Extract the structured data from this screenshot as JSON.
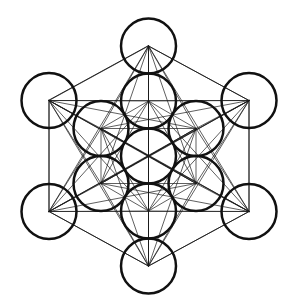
{
  "figure": {
    "subtitle": "Fruit of Life with 78 connecting lines",
    "background_color": "#ffffff",
    "stroke_color": "#111111",
    "line_color": "#1a1a1a",
    "circle_stroke_width": 2.5,
    "line_stroke_width": 0.7,
    "canvas": {
      "width": 292,
      "height": 308
    },
    "circle_radius": 27.5,
    "center": {
      "x": 148.5,
      "y": 156
    },
    "ring_spacing": 55,
    "circle_count": 13,
    "line_count": 78,
    "nodes": [
      {
        "name": "center",
        "ring": 0,
        "x": 148.5,
        "y": 156
      },
      {
        "name": "inner-n",
        "ring": 1,
        "x": 148.5,
        "y": 101
      },
      {
        "name": "inner-ne",
        "ring": 1,
        "x": 196.0,
        "y": 128.5
      },
      {
        "name": "inner-se",
        "ring": 1,
        "x": 196.0,
        "y": 183.5
      },
      {
        "name": "inner-s",
        "ring": 1,
        "x": 148.5,
        "y": 211
      },
      {
        "name": "inner-sw",
        "ring": 1,
        "x": 101.0,
        "y": 183.5
      },
      {
        "name": "inner-nw",
        "ring": 1,
        "x": 101.0,
        "y": 128.5
      },
      {
        "name": "outer-n",
        "ring": 2,
        "x": 148.5,
        "y": 46
      },
      {
        "name": "outer-ne",
        "ring": 2,
        "x": 249.0,
        "y": 100.5
      },
      {
        "name": "outer-se",
        "ring": 2,
        "x": 249.0,
        "y": 211.5
      },
      {
        "name": "outer-s",
        "ring": 2,
        "x": 148.5,
        "y": 266
      },
      {
        "name": "outer-sw",
        "ring": 2,
        "x": 49.0,
        "y": 211.5
      },
      {
        "name": "outer-nw",
        "ring": 2,
        "x": 49.0,
        "y": 100.5
      }
    ],
    "hull_order": [
      "outer-n",
      "outer-ne",
      "outer-se",
      "outer-s",
      "outer-sw",
      "outer-nw"
    ]
  }
}
